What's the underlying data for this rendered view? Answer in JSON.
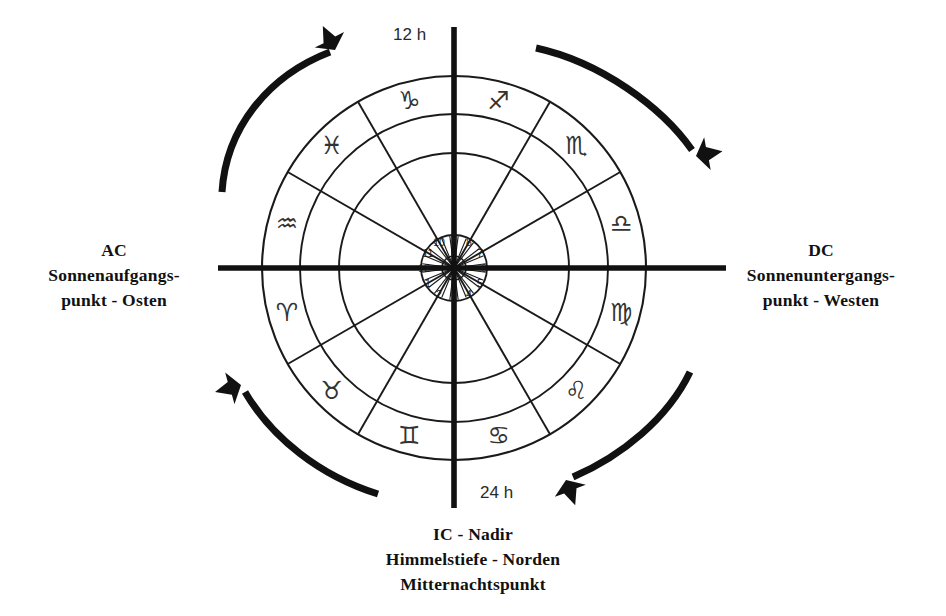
{
  "diagram": {
    "title_hidden": "",
    "center": {
      "x": 454,
      "y": 268
    },
    "radii": {
      "hub": 12,
      "house_ring_inner": 14,
      "house_ring_outer": 33,
      "mid": 115,
      "zodiac_inner": 154,
      "outer": 192
    },
    "axis": {
      "horizontal": {
        "x1": 218,
        "x2": 726,
        "y": 268
      },
      "vertical": {
        "y1": 27,
        "y2": 508,
        "x": 454
      }
    }
  },
  "hour_labels": {
    "top": "12 h",
    "bottom": "24 h"
  },
  "ascendant": {
    "code": "AC",
    "line1": "Sonnenaufgangs-",
    "line2": "punkt - Osten"
  },
  "descendant": {
    "code": "DC",
    "line1": "Sonnenuntergangs-",
    "line2": "punkt - Westen"
  },
  "imum_coeli": {
    "line1": "IC - Nadir",
    "line2": "Himmelstiefe - Norden",
    "line3": "Mitternachtspunkt"
  },
  "houses": {
    "note": "House numbers in inner ring, counterclockwise",
    "items": [
      {
        "number": "12",
        "angle_deg": 180
      },
      {
        "number": "1",
        "angle_deg": 210
      },
      {
        "number": "2",
        "angle_deg": 240
      },
      {
        "number": "3",
        "angle_deg": 270
      },
      {
        "number": "4",
        "angle_deg": 300
      },
      {
        "number": "5",
        "angle_deg": 330
      },
      {
        "number": "6",
        "angle_deg": 0
      },
      {
        "number": "7",
        "angle_deg": 30
      },
      {
        "number": "8",
        "angle_deg": 60
      },
      {
        "number": "9",
        "angle_deg": 90
      },
      {
        "number": "10",
        "angle_deg": 120
      },
      {
        "number": "11",
        "angle_deg": 150
      }
    ]
  },
  "zodiac": {
    "note": "Zodiac signs in outer ring, counterclockwise from Aquarius upper-left",
    "items": [
      {
        "name": "aquarius",
        "glyph": "♒",
        "angle_deg": 165
      },
      {
        "name": "capricorn",
        "glyph": "♑",
        "angle_deg": 105
      },
      {
        "name": "sagittarius",
        "glyph": "♐",
        "angle_deg": 75
      },
      {
        "name": "scorpio",
        "glyph": "♏",
        "angle_deg": 45
      },
      {
        "name": "libra",
        "glyph": "♎",
        "angle_deg": 15
      },
      {
        "name": "virgo",
        "glyph": "♍",
        "angle_deg": 345
      },
      {
        "name": "leo",
        "glyph": "♌",
        "angle_deg": 315
      },
      {
        "name": "cancer",
        "glyph": "♋",
        "angle_deg": 285
      },
      {
        "name": "gemini",
        "glyph": "♊",
        "angle_deg": 255
      },
      {
        "name": "taurus",
        "glyph": "♉",
        "angle_deg": 225
      },
      {
        "name": "aries",
        "glyph": "♈",
        "angle_deg": 195
      },
      {
        "name": "pisces",
        "glyph": "♓",
        "angle_deg": 135
      }
    ]
  },
  "arrows": {
    "note": "Four curved arrows indicating clockwise rotation",
    "items": [
      {
        "name": "arrow-top-left",
        "direction": "clockwise"
      },
      {
        "name": "arrow-top-right",
        "direction": "clockwise"
      },
      {
        "name": "arrow-bottom-right",
        "direction": "clockwise"
      },
      {
        "name": "arrow-bottom-left",
        "direction": "clockwise"
      }
    ]
  },
  "colors": {
    "ink": "#111111",
    "line": "#1a1a1a",
    "glyph": "#333333",
    "background": "#ffffff"
  }
}
